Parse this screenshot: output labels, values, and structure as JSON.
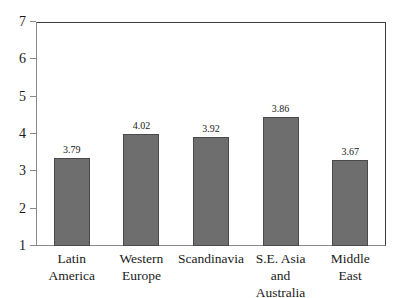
{
  "chart_data": {
    "type": "bar",
    "title": "",
    "xlabel": "",
    "ylabel": "",
    "ylim": [
      1,
      7
    ],
    "yticks": [
      "1",
      "2",
      "3",
      "4",
      "5",
      "6",
      "7"
    ],
    "grid": false,
    "legend": "none",
    "categories": [
      "Latin\nAmerica",
      "Western\nEurope",
      "Scandinavia",
      "S.E. Asia\nand Australia",
      "Middle\nEast"
    ],
    "values": [
      3.79,
      4.02,
      3.92,
      3.86,
      3.67
    ],
    "data_labels": [
      "3.79",
      "4.02",
      "3.92",
      "3.86",
      "3.67"
    ],
    "drawn_values": [
      3.35,
      3.99,
      3.92,
      4.45,
      3.3
    ],
    "bar_color": "#6e6e6e",
    "bar_edge_color": "#4a4a4a",
    "frame_color": "#3a3a3a",
    "axis_color": "#8a8a8a",
    "background": "#ffffff"
  },
  "categories_display": [
    {
      "line1": "Latin",
      "line2": "America"
    },
    {
      "line1": "Western",
      "line2": "Europe"
    },
    {
      "line1": "Scandinavia",
      "line2": ""
    },
    {
      "line1": "S.E. Asia",
      "line2": "and Australia"
    },
    {
      "line1": "Middle",
      "line2": "East"
    }
  ]
}
